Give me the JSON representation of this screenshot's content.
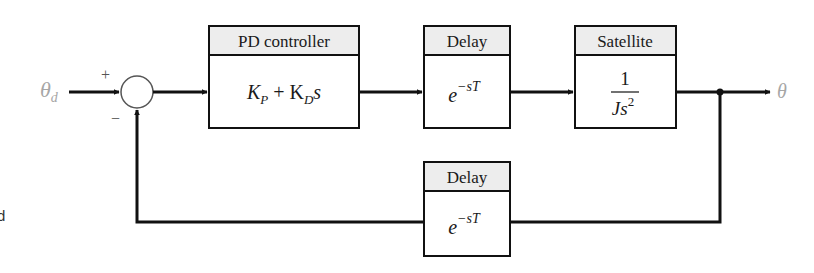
{
  "diagram": {
    "type": "feedback block diagram",
    "input_signal": {
      "symbol": "θ",
      "subscript": "d"
    },
    "output_signal": {
      "symbol": "θ"
    },
    "summing_junction": {
      "plus_sign": "+",
      "minus_sign": "−"
    },
    "blocks": [
      {
        "id": "pd",
        "title": "PD controller",
        "expr_main": "K",
        "sub1": "P",
        "plus": " + K",
        "sub2": "D",
        "tail": "s"
      },
      {
        "id": "delay1",
        "title": "Delay",
        "base": "e",
        "exponent": "−sT"
      },
      {
        "id": "satellite",
        "title": "Satellite",
        "numerator": "1",
        "den_main": "Js",
        "den_exp": "2"
      },
      {
        "id": "delay2",
        "title": "Delay",
        "base": "e",
        "exponent": "−sT"
      }
    ],
    "edge_fragment": "d",
    "colors": {
      "line": "#111111",
      "header_fill": "#ededed",
      "signal_label": "#a6a6a6"
    }
  }
}
